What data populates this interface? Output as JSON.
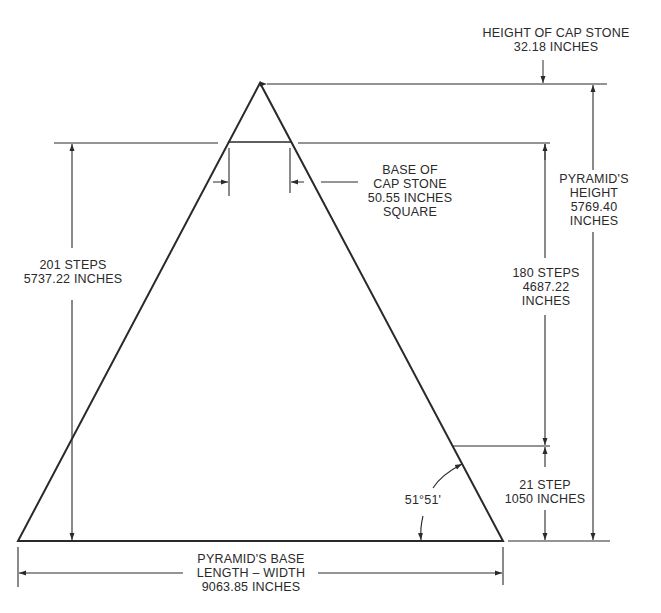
{
  "diagram": {
    "line_color": "#2a2a2a",
    "labels": {
      "cap_height": {
        "line1": "HEIGHT OF CAP STONE",
        "line2": "32.18 INCHES"
      },
      "cap_base": {
        "line1": "BASE OF",
        "line2": "CAP STONE",
        "line3": "50.55  INCHES",
        "line4": "SQUARE"
      },
      "left_steps": {
        "line1": "201 STEPS",
        "line2": "5737.22 INCHES"
      },
      "pyramid_height": {
        "line1": "PYRAMID'S",
        "line2": "HEIGHT",
        "line3": "5769.40",
        "line4": "INCHES"
      },
      "upper_steps": {
        "line1": "180 STEPS",
        "line2": "4687.22",
        "line3": "INCHES"
      },
      "lower_steps": {
        "line1": "21 STEP",
        "line2": "1050 INCHES"
      },
      "angle": "51°51'",
      "base": {
        "line1": "PYRAMID'S BASE",
        "line2": "LENGTH – WIDTH",
        "line3": "9063.85 INCHES"
      }
    }
  }
}
